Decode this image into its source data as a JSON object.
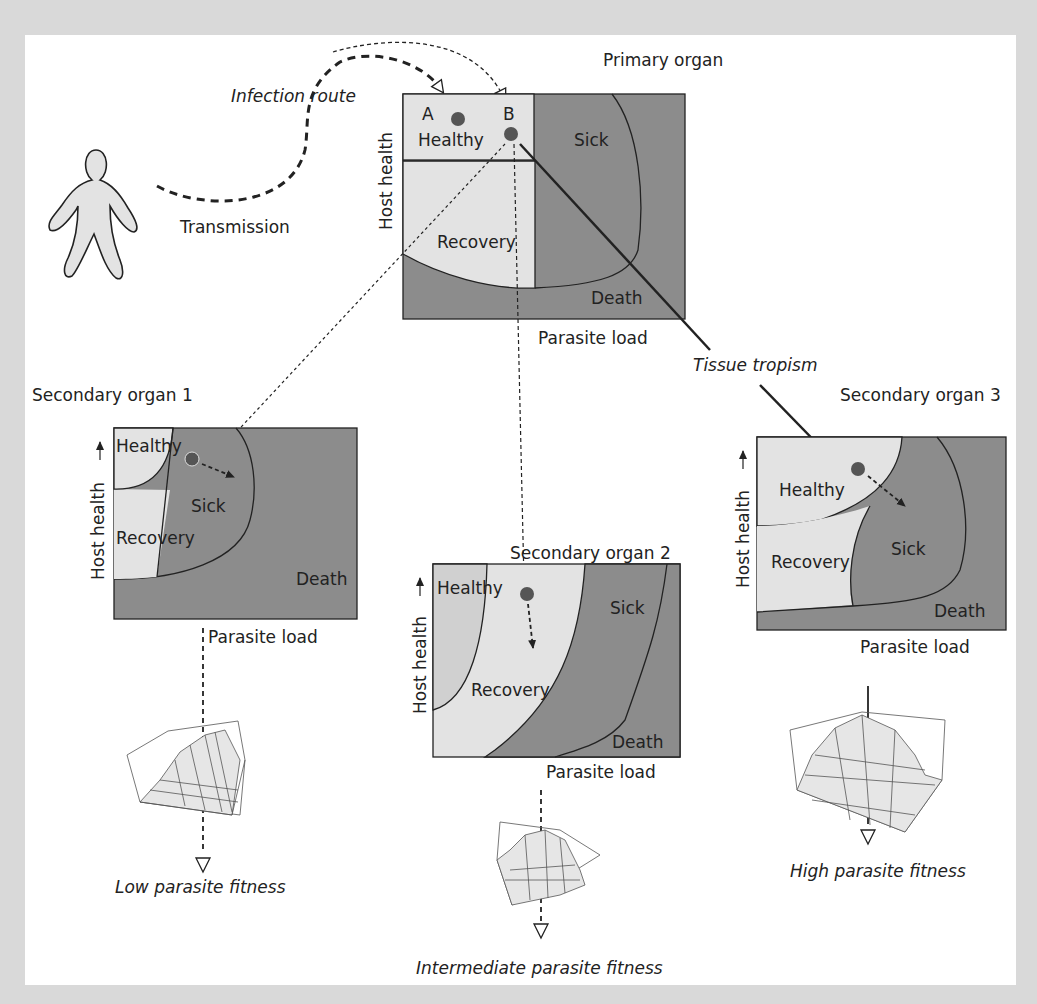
{
  "colors": {
    "background": "#d9d9d9",
    "panel": "#ffffff",
    "light_region": "#e3e3e3",
    "dark_region": "#8c8c8c",
    "dot": "#555555",
    "line": "#222222"
  },
  "person": {
    "label": "Transmission",
    "route_label": "Infection route"
  },
  "primary": {
    "title": "Primary organ",
    "y_axis": "Host health",
    "x_axis": "Parasite load",
    "points": [
      "A",
      "B"
    ],
    "regions": [
      "Healthy",
      "Sick",
      "Recovery",
      "Death"
    ]
  },
  "tropism_label": "Tissue tropism",
  "secondary": [
    {
      "title": "Secondary organ 1",
      "y_axis": "Host health",
      "x_axis": "Parasite load",
      "regions": [
        "Healthy",
        "Sick",
        "Recovery",
        "Death"
      ],
      "outcome": "Low parasite fitness"
    },
    {
      "title": "Secondary organ 2",
      "y_axis": "Host health",
      "x_axis": "Parasite load",
      "regions": [
        "Healthy",
        "Sick",
        "Recovery",
        "Death"
      ],
      "outcome": "Intermediate parasite fitness"
    },
    {
      "title": "Secondary organ 3",
      "y_axis": "Host health",
      "x_axis": "Parasite load",
      "regions": [
        "Healthy",
        "Sick",
        "Recovery",
        "Death"
      ],
      "outcome": "High parasite fitness"
    }
  ]
}
